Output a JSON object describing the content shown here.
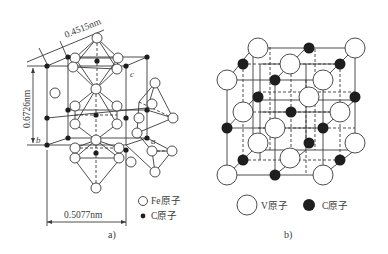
{
  "figure": {
    "panels": [
      {
        "id": "a",
        "caption": "a)",
        "description": "Fe3C (cementite) orthorhombic unit cell",
        "dimensions": {
          "top": "0.4515nm",
          "left": "0.6726nm",
          "bottom": "0.5077nm"
        },
        "axes": {
          "a": "a",
          "b": "b",
          "c": "c"
        },
        "legend": [
          {
            "symbol": "open-circle",
            "label": "Fe原子"
          },
          {
            "symbol": "filled-dot",
            "label": "C原子"
          }
        ]
      },
      {
        "id": "b",
        "caption": "b)",
        "description": "VC NaCl-type cubic unit cell",
        "legend": [
          {
            "symbol": "open-circle",
            "label": "V原子"
          },
          {
            "symbol": "filled-dot",
            "label": "C原子"
          }
        ]
      }
    ]
  },
  "colors": {
    "line": "#3a3a3a",
    "atom_fill_open": "#ffffff",
    "atom_fill_dark": "#1e1e1e",
    "background": "#ffffff"
  }
}
